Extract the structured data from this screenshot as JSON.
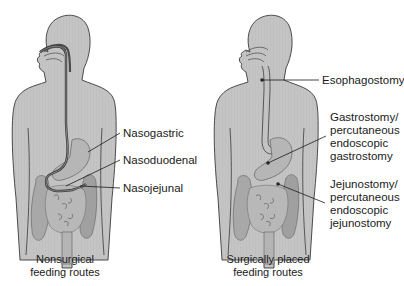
{
  "figure": {
    "colors": {
      "body_fill": "#c2c2c2",
      "body_outline": "#3a3a3a",
      "tube": "#4a4a4a",
      "intestine_fill": "#b0b0b0",
      "intestine_shadow": "#8c8c8c",
      "leader_line": "#1a1a1a",
      "text": "#1a1a1a",
      "background": "#ffffff"
    },
    "panels": [
      {
        "id": "nonsurgical",
        "caption": "Nonsurgical\nfeeding routes",
        "labels": [
          {
            "text": "Nasogastric"
          },
          {
            "text": "Nasoduodenal"
          },
          {
            "text": "Nasojejunal"
          }
        ]
      },
      {
        "id": "surgical",
        "caption": "Surgically placed\nfeeding routes",
        "labels": [
          {
            "text": "Esophagostomy"
          },
          {
            "text": "Gastrostomy/\npercutaneous\nendoscopic\ngastrostomy"
          },
          {
            "text": "Jejunostomy/\npercutaneous\nendoscopic\njejunostomy"
          }
        ]
      }
    ]
  }
}
